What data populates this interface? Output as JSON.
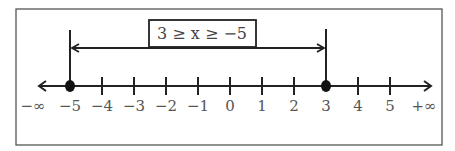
{
  "diagram": {
    "type": "number-line",
    "inequality_label": "3 ≥ x ≥ −5",
    "left_infinity": "−∞",
    "right_infinity": "+∞",
    "ticks": [
      {
        "value": -5,
        "label": "−5"
      },
      {
        "value": -4,
        "label": "−4"
      },
      {
        "value": -3,
        "label": "−3"
      },
      {
        "value": -2,
        "label": "−2"
      },
      {
        "value": -1,
        "label": "−1"
      },
      {
        "value": 0,
        "label": "0"
      },
      {
        "value": 1,
        "label": "1"
      },
      {
        "value": 2,
        "label": "2"
      },
      {
        "value": 3,
        "label": "3"
      },
      {
        "value": 4,
        "label": "4"
      },
      {
        "value": 5,
        "label": "5"
      }
    ],
    "interval": {
      "lower": -5,
      "upper": 3,
      "lower_closed": true,
      "upper_closed": true
    },
    "colors": {
      "line": "#222222",
      "text": "#555555",
      "frame": "#555555"
    }
  }
}
